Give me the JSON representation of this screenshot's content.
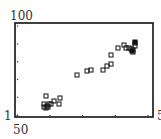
{
  "chart_data": {
    "type": "scatter",
    "title": "",
    "xlabel": "",
    "ylabel": "",
    "y_scale": "log",
    "ylim": [
      1,
      100
    ],
    "xlim_labels": [
      "50",
      "5"
    ],
    "y_tick_labels": {
      "top": "100",
      "bottom": "1"
    },
    "x_tick_labels": {
      "left": "50",
      "right": "5"
    },
    "x_tick_count": 5,
    "y_tick_count": 6,
    "grid": false,
    "legend": null,
    "marker": "square-open",
    "series": [
      {
        "name": "points",
        "points_px": [
          [
            44,
            104
          ],
          [
            47,
            106
          ],
          [
            44,
            107
          ],
          [
            46,
            108
          ],
          [
            49,
            104
          ],
          [
            51,
            104
          ],
          [
            48,
            107
          ],
          [
            54,
            101
          ],
          [
            59,
            104
          ],
          [
            60,
            98
          ],
          [
            46,
            96
          ],
          [
            77,
            75
          ],
          [
            87,
            71
          ],
          [
            91,
            70
          ],
          [
            103,
            70
          ],
          [
            107,
            66
          ],
          [
            111,
            64
          ],
          [
            111,
            55
          ],
          [
            118,
            48
          ],
          [
            124,
            45
          ],
          [
            126,
            48
          ],
          [
            129,
            48
          ],
          [
            131,
            49
          ],
          [
            133,
            52
          ],
          [
            133,
            50
          ],
          [
            135,
            43
          ],
          [
            135,
            46
          ]
        ],
        "filled_points_px": [
          [
            132,
            51
          ],
          [
            135,
            42
          ]
        ]
      }
    ]
  },
  "labels": {
    "y_top": "100",
    "y_bottom": "1",
    "x_left": "50",
    "x_right": "5"
  },
  "colors": {
    "frame": "#111111",
    "marker": "#111111",
    "tick": "#333333",
    "background": "#ffffff"
  }
}
